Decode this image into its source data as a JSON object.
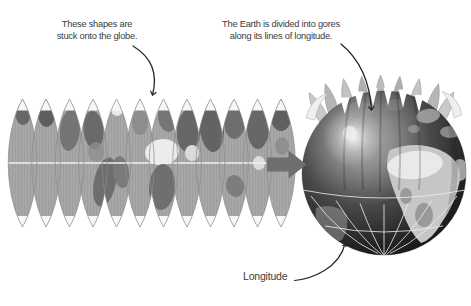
{
  "labels": {
    "left_note": "These shapes are\nstuck onto the globe.",
    "right_note": "The Earth is divided into gores\nalong its lines of longitude.",
    "longitude": "Longitude"
  },
  "illustration": {
    "gore_strip": {
      "gore_count": 12,
      "description": "world map cut into lens-shaped gores"
    },
    "globe": {
      "description": "globe with gores being stuck on, tips peeling at the north pole"
    },
    "colors": {
      "text": "#3b3b3b",
      "gore_fill": "#a7a7a7",
      "gore_outline": "#8c8c8c",
      "equator_line": "#f0f0f0",
      "block_arrow": "#6f6f6f",
      "globe_dark": "#151515",
      "continent_light": "#c6c6c6",
      "grid_line": "#eeeeee",
      "annotation_arrow": "#262626"
    }
  }
}
